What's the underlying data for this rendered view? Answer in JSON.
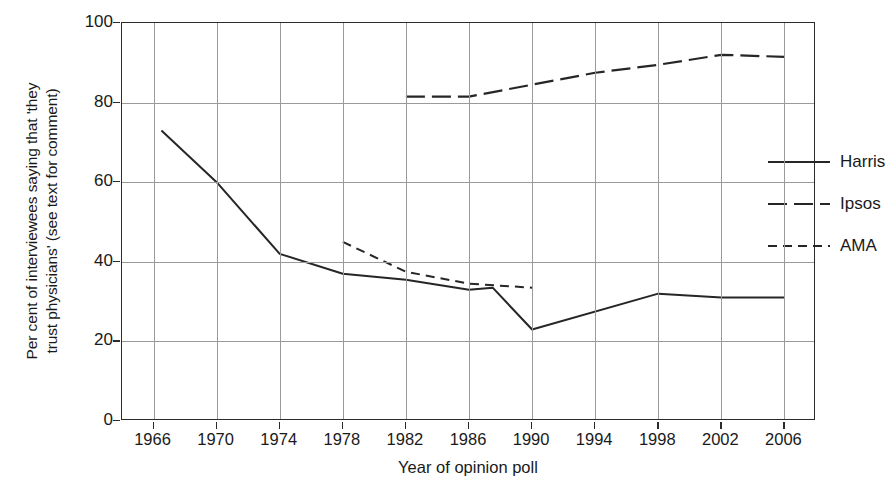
{
  "chart_data": {
    "type": "line",
    "title": "",
    "xlabel": "Year of opinion poll",
    "ylabel_line1": "Per cent of interviewees saying that 'they",
    "ylabel_line2": "trust physicians' (see text for comment)",
    "xlim": [
      1964,
      2008
    ],
    "ylim": [
      0,
      100
    ],
    "grid": true,
    "legend_position": "upper right",
    "xticks": [
      1966,
      1970,
      1974,
      1978,
      1982,
      1986,
      1990,
      1994,
      1998,
      2002,
      2006
    ],
    "xtick_labels": [
      "1966",
      "1970",
      "1974",
      "1978",
      "1982",
      "1986",
      "1990",
      "1994",
      "1998",
      "2002",
      "2006"
    ],
    "yticks": [
      0,
      20,
      40,
      60,
      80,
      100
    ],
    "ytick_labels": [
      "0",
      "20",
      "40",
      "60",
      "80",
      "100"
    ],
    "series": [
      {
        "name": "Harris",
        "style": "solid",
        "color": "#262626",
        "x": [
          1966.5,
          1970,
          1974,
          1978,
          1982,
          1986,
          1987.5,
          1990,
          1998,
          2002,
          2006
        ],
        "values": [
          73,
          60,
          42,
          37,
          35.5,
          33,
          33.5,
          23,
          32,
          31,
          31
        ]
      },
      {
        "name": "Ipsos",
        "style": "long-dash",
        "color": "#262626",
        "x": [
          1982,
          1986,
          1990,
          1994,
          1998,
          2002,
          2006
        ],
        "values": [
          81.5,
          81.5,
          84.5,
          87.5,
          89.5,
          92,
          91.5
        ]
      },
      {
        "name": "AMA",
        "style": "short-dash",
        "color": "#262626",
        "x": [
          1978,
          1982,
          1986,
          1990
        ],
        "values": [
          45,
          37.5,
          34.5,
          33.5
        ]
      }
    ]
  },
  "legend": {
    "items": [
      {
        "label": "Harris",
        "style": "solid"
      },
      {
        "label": "Ipsos",
        "style": "long-dash"
      },
      {
        "label": "AMA",
        "style": "short-dash"
      }
    ]
  },
  "colors": {
    "line": "#262626",
    "grid": "#9a9a9a",
    "frame": "#2b2b2b",
    "background": "#ffffff"
  }
}
